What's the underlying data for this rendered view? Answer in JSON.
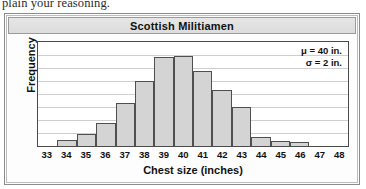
{
  "page": {
    "surrounding_text": "plain your reasoning."
  },
  "figure": {
    "title": "Scottish Militiamen",
    "annotations": {
      "mean": "μ = 40 in.",
      "sd": "σ = 2 in."
    }
  },
  "chart_data": {
    "type": "bar",
    "title": "Scottish Militiamen",
    "xlabel": "Chest size (inches)",
    "ylabel": "Frequency",
    "categories": [
      "33",
      "34",
      "35",
      "36",
      "37",
      "38",
      "39",
      "40",
      "41",
      "42",
      "43",
      "44",
      "45",
      "46",
      "47",
      "48"
    ],
    "values": [
      0,
      0.45,
      0.95,
      1.75,
      3.3,
      5.0,
      6.85,
      6.95,
      5.8,
      4.3,
      3.0,
      0.7,
      0.4,
      0.3,
      0,
      0
    ],
    "ylim": [
      0,
      8
    ],
    "gridlines": 8,
    "grid": true,
    "y_tick_labels": [],
    "legend": "none",
    "annotations": [
      "μ = 40 in.",
      "σ = 2 in."
    ],
    "colors": {
      "bar_fill": "#d4d4d4",
      "bar_stroke": "#4f4f4f",
      "grid": "#cfcfcf",
      "title_bar": "#e0e0e0",
      "frame": "#8c8c8c"
    }
  }
}
